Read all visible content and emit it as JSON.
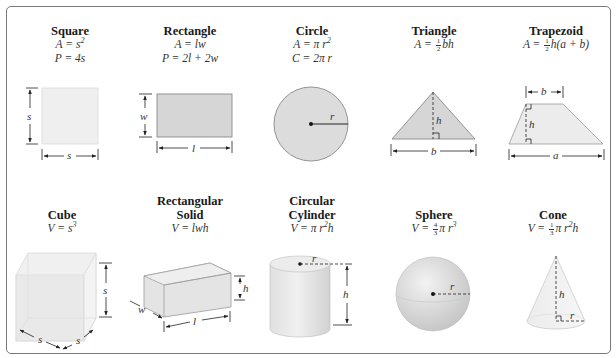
{
  "figure": {
    "rows": [
      {
        "name": "2d-shapes",
        "shapes": [
          {
            "id": "square",
            "title": "Square",
            "formulas": [
              "A = s²",
              "P = 4s"
            ],
            "labels": {
              "side_vertical": "s",
              "side_horizontal": "s"
            }
          },
          {
            "id": "rectangle",
            "title": "Rectangle",
            "formulas": [
              "A = lw",
              "P = 2l + 2w"
            ],
            "labels": {
              "width": "w",
              "length": "l"
            }
          },
          {
            "id": "circle",
            "title": "Circle",
            "formulas": [
              "A = πr²",
              "C = 2πr"
            ],
            "labels": {
              "radius": "r"
            }
          },
          {
            "id": "triangle",
            "title": "Triangle",
            "formulas": [
              "A = ½bh"
            ],
            "labels": {
              "height": "h",
              "base": "b"
            }
          },
          {
            "id": "trapezoid",
            "title": "Trapezoid",
            "formulas": [
              "A = ½h(a + b)"
            ],
            "labels": {
              "top": "b",
              "height": "h",
              "bottom": "a"
            }
          }
        ]
      },
      {
        "name": "3d-solids",
        "shapes": [
          {
            "id": "cube",
            "title": "Cube",
            "formulas": [
              "V = s³"
            ],
            "labels": {
              "height": "s",
              "front": "s",
              "side": "s"
            }
          },
          {
            "id": "rectangular-solid",
            "title_lines": [
              "Rectangular",
              "Solid"
            ],
            "formulas": [
              "V = lwh"
            ],
            "labels": {
              "height": "h",
              "width": "w",
              "length": "l"
            }
          },
          {
            "id": "circular-cylinder",
            "title_lines": [
              "Circular",
              "Cylinder"
            ],
            "formulas": [
              "V = πr²h"
            ],
            "labels": {
              "radius": "r",
              "height": "h"
            }
          },
          {
            "id": "sphere",
            "title": "Sphere",
            "formulas": [
              "V = (4/3)πr³"
            ],
            "labels": {
              "radius": "r"
            }
          },
          {
            "id": "cone",
            "title": "Cone",
            "formulas": [
              "V = (1/3)πr²h"
            ],
            "labels": {
              "height": "h",
              "radius": "r"
            }
          }
        ]
      }
    ],
    "colors": {
      "fill_light": "#ececec",
      "fill_mid": "#d6d6d6",
      "stroke": "#7d7d7d",
      "line": "#222222",
      "border": "#7a7a7a"
    }
  }
}
